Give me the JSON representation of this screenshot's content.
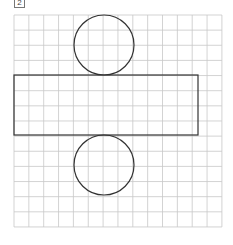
{
  "label": "2",
  "figure": {
    "grid": {
      "x": 14,
      "y": 15,
      "cols": 14,
      "rows": 14,
      "cell_w": 14.85,
      "cell_h": 15.14,
      "line_color": "#c8c8c8"
    },
    "shapes": {
      "top_circle": {
        "cx": 104,
        "cy": 45,
        "r": 30
      },
      "rectangle": {
        "x": 14,
        "y": 75,
        "width": 184,
        "height": 60
      },
      "bottom_circle": {
        "cx": 104,
        "cy": 165,
        "r": 30
      },
      "stroke_color": "#333333"
    }
  }
}
